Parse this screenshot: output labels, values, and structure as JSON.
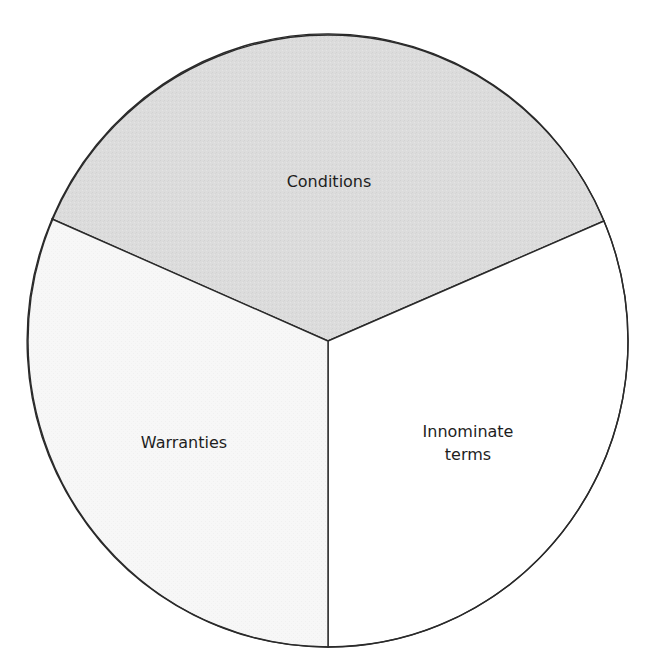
{
  "diagram": {
    "type": "pie-sectors",
    "title": "",
    "sectors": [
      {
        "label": "Conditions",
        "lines": [
          "Conditions"
        ],
        "fill": "#dcdcdc",
        "share": 0.3333
      },
      {
        "label": "Innominate terms",
        "lines": [
          "Innominate",
          "terms"
        ],
        "fill": "#ffffff",
        "share": 0.3333
      },
      {
        "label": "Warranties",
        "lines": [
          "Warranties"
        ],
        "fill": "#f6f6f6",
        "share": 0.3333
      }
    ],
    "stroke_color": "#2a2a2a"
  }
}
